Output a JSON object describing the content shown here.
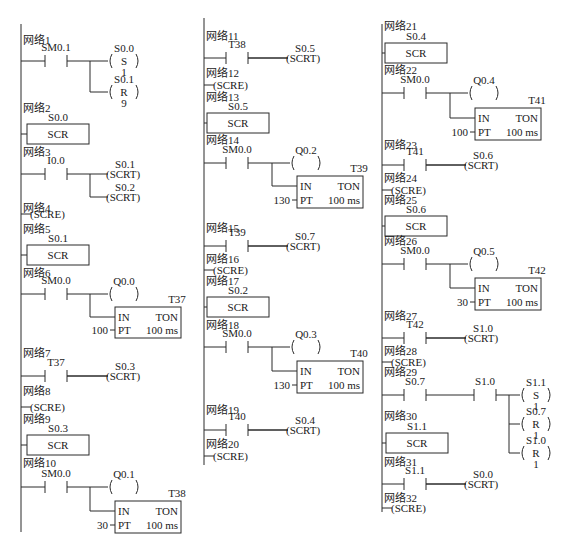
{
  "diagram": {
    "colors": {
      "line": "#2a2a2a",
      "text": "#1a1a1a",
      "background": "#ffffff"
    },
    "network_prefix": "网络",
    "columns": [
      {
        "rail_x": 21,
        "rail_top": 24,
        "rail_bottom": 532,
        "networks": [
          {
            "id": 1,
            "label_y": 44,
            "rung_y": 61,
            "type": "contact_coils",
            "contacts": [
              {
                "name": "SM0.1",
                "x": 45,
                "w": 22
              }
            ],
            "branch_x": 90,
            "coils": [
              {
                "operand": "S0.0",
                "op": "S",
                "param": "1",
                "y": 61
              },
              {
                "operand": "S0.1",
                "op": "R",
                "param": "9",
                "y": 92
              }
            ],
            "coil_x": 108
          },
          {
            "id": 2,
            "label_y": 112,
            "type": "scr",
            "operand": "S0.0",
            "label": "SCR",
            "box": [
              27,
              124,
              62,
              20
            ]
          },
          {
            "id": 3,
            "label_y": 156,
            "rung_y": 174,
            "type": "contact_scrt",
            "contacts": [
              {
                "name": "I0.0",
                "x": 45,
                "w": 22
              }
            ],
            "branch_x": 90,
            "outputs": [
              {
                "operand": "S0.1",
                "y": 174
              },
              {
                "operand": "S0.2",
                "y": 197
              }
            ],
            "coil_x": 108
          },
          {
            "id": 4,
            "label_y": 212,
            "type": "scre",
            "rung_y": 214,
            "label": "(SCRE)"
          },
          {
            "id": 5,
            "label_y": 233,
            "type": "scr",
            "operand": "S0.1",
            "label": "SCR",
            "box": [
              27,
              245,
              62,
              20
            ]
          },
          {
            "id": 6,
            "label_y": 277,
            "rung_y": 294,
            "type": "contact_coil_timer",
            "contacts": [
              {
                "name": "SM0.0",
                "x": 45,
                "w": 22
              }
            ],
            "branch_x": 90,
            "coil": {
              "operand": "Q0.0",
              "x": 108
            },
            "timer": {
              "name": "T37",
              "type": "TON",
              "in": "IN",
              "pt_label": "PT",
              "preset": "100",
              "base": "100 ms",
              "box": [
                115,
                307,
                66,
                31
              ]
            }
          },
          {
            "id": 7,
            "label_y": 357,
            "rung_y": 376,
            "type": "contact_scrt",
            "contacts": [
              {
                "name": "T37",
                "x": 45,
                "w": 22
              }
            ],
            "outputs": [
              {
                "operand": "S0.3",
                "y": 376
              }
            ],
            "coil_x": 108
          },
          {
            "id": 8,
            "label_y": 395,
            "type": "scre",
            "rung_y": 407,
            "label": "(SCRE)"
          },
          {
            "id": 9,
            "label_y": 423,
            "type": "scr",
            "operand": "S0.3",
            "label": "SCR",
            "box": [
              27,
              435,
              62,
              20
            ]
          },
          {
            "id": 10,
            "label_y": 467,
            "rung_y": 487,
            "type": "contact_coil_timer",
            "contacts": [
              {
                "name": "SM0.0",
                "x": 45,
                "w": 22
              }
            ],
            "branch_x": 90,
            "coil": {
              "operand": "Q0.1",
              "x": 108
            },
            "timer": {
              "name": "T38",
              "type": "TON",
              "in": "IN",
              "pt_label": "PT",
              "preset": "30",
              "base": "100 ms",
              "box": [
                115,
                501,
                66,
                32
              ]
            }
          }
        ]
      },
      {
        "rail_x": 204,
        "rail_top": 18,
        "rail_bottom": 465,
        "networks": [
          {
            "id": 11,
            "label_y": 40,
            "rung_y": 58,
            "type": "contact_scrt",
            "contacts": [
              {
                "name": "T38",
                "x": 226,
                "w": 22
              }
            ],
            "outputs": [
              {
                "operand": "S0.5",
                "y": 58
              }
            ],
            "coil_x": 288
          },
          {
            "id": 12,
            "label_y": 77,
            "type": "scre",
            "rung_y": 85,
            "label": "(SCRE)"
          },
          {
            "id": 13,
            "label_y": 101,
            "type": "scr",
            "operand": "S0.5",
            "label": "SCR",
            "box": [
              207,
              113,
              62,
              20
            ]
          },
          {
            "id": 14,
            "label_y": 144,
            "rung_y": 163,
            "type": "contact_coil_timer",
            "contacts": [
              {
                "name": "SM0.0",
                "x": 226,
                "w": 22
              }
            ],
            "branch_x": 272,
            "coil": {
              "operand": "Q0.2",
              "x": 290
            },
            "timer": {
              "name": "T39",
              "type": "TON",
              "in": "IN",
              "pt_label": "PT",
              "preset": "130",
              "base": "100 ms",
              "box": [
                297,
                176,
                66,
                32
              ]
            }
          },
          {
            "id": 15,
            "label_y": 232,
            "rung_y": 246,
            "type": "contact_scrt",
            "contacts": [
              {
                "name": "T39",
                "x": 226,
                "w": 22
              }
            ],
            "outputs": [
              {
                "operand": "S0.7",
                "y": 246
              }
            ],
            "coil_x": 288
          },
          {
            "id": 16,
            "label_y": 263,
            "type": "scre",
            "rung_y": 270,
            "label": "(SCRE)"
          },
          {
            "id": 17,
            "label_y": 285,
            "type": "scr",
            "operand": "S0.2",
            "label": "SCR",
            "box": [
              207,
              297,
              62,
              20
            ]
          },
          {
            "id": 18,
            "label_y": 329,
            "rung_y": 347,
            "type": "contact_coil_timer",
            "contacts": [
              {
                "name": "SM0.0",
                "x": 226,
                "w": 22
              }
            ],
            "branch_x": 272,
            "coil": {
              "operand": "Q0.3",
              "x": 290
            },
            "timer": {
              "name": "T40",
              "type": "TON",
              "in": "IN",
              "pt_label": "PT",
              "preset": "130",
              "base": "100 ms",
              "box": [
                297,
                361,
                66,
                32
              ]
            }
          },
          {
            "id": 19,
            "label_y": 414,
            "rung_y": 430,
            "type": "contact_scrt",
            "contacts": [
              {
                "name": "T40",
                "x": 226,
                "w": 22
              }
            ],
            "outputs": [
              {
                "operand": "S0.4",
                "y": 430
              }
            ],
            "coil_x": 288
          },
          {
            "id": 20,
            "label_y": 448,
            "type": "scre",
            "rung_y": 456,
            "label": "(SCRE)"
          }
        ]
      },
      {
        "rail_x": 382,
        "rail_top": 24,
        "rail_bottom": 512,
        "networks": [
          {
            "id": 21,
            "label_y": 30,
            "type": "scr",
            "operand": "S0.4",
            "label": "SCR",
            "box": [
              385,
              43,
              62,
              20
            ]
          },
          {
            "id": 22,
            "label_y": 74,
            "rung_y": 93,
            "type": "contact_coil_timer",
            "contacts": [
              {
                "name": "SM0.0",
                "x": 404,
                "w": 22
              }
            ],
            "branch_x": 450,
            "coil": {
              "operand": "Q0.4",
              "x": 468
            },
            "timer": {
              "name": "T41",
              "type": "TON",
              "in": "IN",
              "pt_label": "PT",
              "preset": "100",
              "base": "100 ms",
              "box": [
                475,
                108,
                66,
                32
              ]
            }
          },
          {
            "id": 23,
            "label_y": 149,
            "rung_y": 165,
            "type": "contact_scrt",
            "contacts": [
              {
                "name": "T41",
                "x": 404,
                "w": 22
              }
            ],
            "outputs": [
              {
                "operand": "S0.6",
                "y": 165
              }
            ],
            "coil_x": 466
          },
          {
            "id": 24,
            "label_y": 182,
            "type": "scre",
            "rung_y": 190,
            "label": "(SCRE)"
          },
          {
            "id": 25,
            "label_y": 204,
            "type": "scr",
            "operand": "S0.6",
            "label": "SCR",
            "box": [
              385,
              216,
              62,
              20
            ]
          },
          {
            "id": 26,
            "label_y": 245,
            "rung_y": 264,
            "type": "contact_coil_timer",
            "contacts": [
              {
                "name": "SM0.0",
                "x": 404,
                "w": 22
              }
            ],
            "branch_x": 450,
            "coil": {
              "operand": "Q0.5",
              "x": 468
            },
            "timer": {
              "name": "T42",
              "type": "TON",
              "in": "IN",
              "pt_label": "PT",
              "preset": "30",
              "base": "100 ms",
              "box": [
                475,
                278,
                66,
                32
              ]
            }
          },
          {
            "id": 27,
            "label_y": 320,
            "rung_y": 338,
            "type": "contact_scrt",
            "contacts": [
              {
                "name": "T42",
                "x": 404,
                "w": 22
              }
            ],
            "outputs": [
              {
                "operand": "S1.0",
                "y": 338
              }
            ],
            "coil_x": 466
          },
          {
            "id": 28,
            "label_y": 355,
            "type": "scre",
            "rung_y": 362,
            "label": "(SCRE)"
          },
          {
            "id": 29,
            "label_y": 376,
            "rung_y": 395,
            "type": "contact_coils",
            "contacts": [
              {
                "name": "S0.7",
                "x": 404,
                "w": 22
              },
              {
                "name": "S1.0",
                "x": 474,
                "w": 22
              }
            ],
            "branch_x": 509,
            "coils": [
              {
                "operand": "S1.1",
                "op": "S",
                "param": "1",
                "y": 395
              },
              {
                "operand": "S0.7",
                "op": "R",
                "param": "1",
                "y": 424
              },
              {
                "operand": "S1.0",
                "op": "R",
                "param": "1",
                "y": 453
              }
            ],
            "coil_x": 520
          },
          {
            "id": 30,
            "label_y": 420,
            "type": "scr",
            "operand": "S1.1",
            "label": "SCR",
            "box": [
              386,
              433,
              62,
              20
            ]
          },
          {
            "id": 31,
            "label_y": 466,
            "rung_y": 484,
            "type": "contact_scrt",
            "contacts": [
              {
                "name": "S1.1",
                "x": 404,
                "w": 22
              }
            ],
            "outputs": [
              {
                "operand": "S0.0",
                "y": 484
              }
            ],
            "coil_x": 466
          },
          {
            "id": 32,
            "label_y": 502,
            "type": "scre",
            "rung_y": 508,
            "label": "(SCRE)"
          }
        ]
      }
    ]
  }
}
